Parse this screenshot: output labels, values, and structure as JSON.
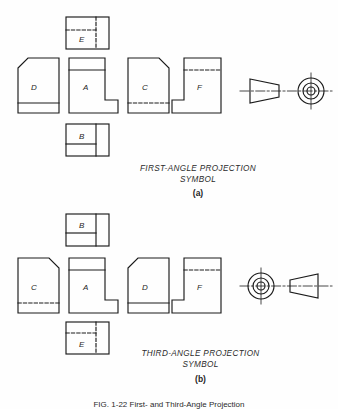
{
  "figure": {
    "caption": "FIG. 1-22   First- and Third-Angle Projection",
    "background_color": "#fefefe",
    "line_color": "#1a1a1a"
  },
  "panels": [
    {
      "key": "first_angle",
      "title_line1": "FIRST-ANGLE PROJECTION",
      "title_line2": "SYMBOL",
      "subcaption": "(a)",
      "views": [
        {
          "id": "E",
          "label": "E",
          "position": "top",
          "shape": "plan-rect",
          "hidden_lines": true
        },
        {
          "id": "D",
          "label": "D",
          "position": "left",
          "shape": "chamfer-left",
          "hidden_lines": false
        },
        {
          "id": "A",
          "label": "A",
          "position": "center",
          "shape": "boot-right",
          "hidden_lines": false
        },
        {
          "id": "C",
          "label": "C",
          "position": "right",
          "shape": "chamfer-right",
          "hidden_lines": true
        },
        {
          "id": "F",
          "label": "F",
          "position": "far-right",
          "shape": "boot-left",
          "hidden_lines": true
        },
        {
          "id": "B",
          "label": "B",
          "position": "bottom",
          "shape": "plan-rect",
          "hidden_lines": false
        }
      ],
      "symbol": {
        "cone_side": "left",
        "circles_side": "right"
      }
    },
    {
      "key": "third_angle",
      "title_line1": "THIRD-ANGLE PROJECTION",
      "title_line2": "SYMBOL",
      "subcaption": "(b)",
      "views": [
        {
          "id": "B",
          "label": "B",
          "position": "top",
          "shape": "plan-rect",
          "hidden_lines": false
        },
        {
          "id": "C",
          "label": "C",
          "position": "left",
          "shape": "chamfer-right",
          "hidden_lines": true
        },
        {
          "id": "A",
          "label": "A",
          "position": "center",
          "shape": "boot-right",
          "hidden_lines": false
        },
        {
          "id": "D",
          "label": "D",
          "position": "right",
          "shape": "chamfer-left",
          "hidden_lines": false
        },
        {
          "id": "F",
          "label": "F",
          "position": "far-right",
          "shape": "boot-left",
          "hidden_lines": true
        },
        {
          "id": "E",
          "label": "E",
          "position": "bottom",
          "shape": "plan-rect",
          "hidden_lines": true
        }
      ],
      "symbol": {
        "cone_side": "right",
        "circles_side": "left"
      }
    }
  ]
}
